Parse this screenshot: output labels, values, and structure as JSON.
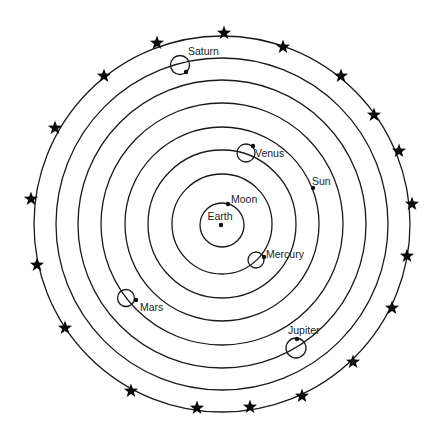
{
  "diagram": {
    "type": "geocentric-model",
    "center": {
      "x": 222,
      "y": 224
    },
    "colors": {
      "line": "#1a1a1a",
      "background": "#ffffff",
      "star": "#0a0a0a"
    },
    "orbits": [
      {
        "name": "Moon",
        "radius": 22
      },
      {
        "name": "Mercury",
        "radius": 50
      },
      {
        "name": "Venus",
        "radius": 74
      },
      {
        "name": "Sun",
        "radius": 97
      },
      {
        "name": "Mars",
        "radius": 121
      },
      {
        "name": "Jupiter",
        "radius": 144
      },
      {
        "name": "Saturn",
        "radius": 166
      },
      {
        "name": "Fixed Stars",
        "radius": 189
      }
    ],
    "bodies": {
      "earth": {
        "label": "Earth"
      },
      "moon": {
        "label": "Moon"
      },
      "mercury": {
        "label": "Mercury"
      },
      "venus": {
        "label": "Venus"
      },
      "sun": {
        "label": "Sun"
      },
      "mars": {
        "label": "Mars"
      },
      "jupiter": {
        "label": "Jupiter"
      },
      "saturn": {
        "label": "Saturn"
      }
    },
    "star_count": 19
  }
}
